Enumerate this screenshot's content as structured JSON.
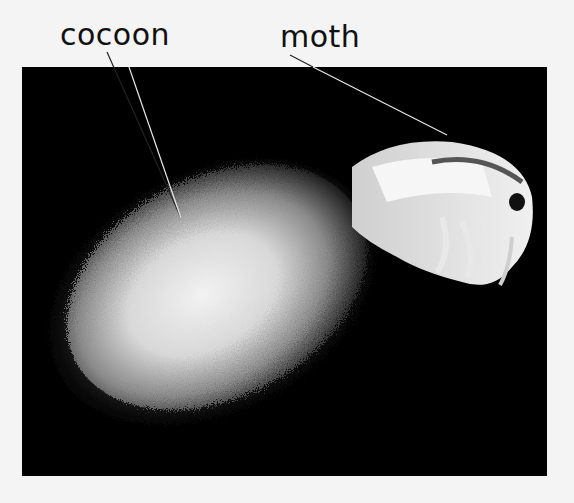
{
  "labels": {
    "cocoon": "cocoon",
    "moth": "moth"
  },
  "colors": {
    "background": "#f4f4f4",
    "photo_background": "#000000",
    "label_text": "#111111",
    "leader_line": "#e8e8e8"
  }
}
